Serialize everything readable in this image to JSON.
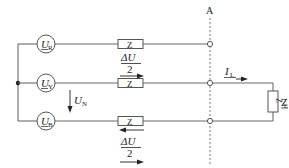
{
  "diagram": {
    "section_label": "A",
    "phases": [
      {
        "id": "R",
        "source_symbol": "U",
        "source_subscript": "R",
        "impedance_label": "Z",
        "drop_label_num": "ΔU",
        "drop_label_den": "2",
        "drop_arrow": "right"
      },
      {
        "id": "Y",
        "source_symbol": "U",
        "source_subscript": "Y",
        "impedance_label": "Z",
        "drop_arrow": "right"
      },
      {
        "id": "B",
        "source_symbol": "U",
        "source_subscript": "B",
        "impedance_label": "Z",
        "drop_label_num": "ΔU",
        "drop_label_den": "2",
        "drop_arrow_top": "left",
        "drop_arrow_bottom": "right"
      }
    ],
    "neutral_voltage": {
      "symbol": "U",
      "subscript": "N"
    },
    "load_current": {
      "symbol": "I",
      "subscript": "L"
    },
    "load": {
      "symbol": "Z",
      "subscript": "L",
      "box_label": "Z"
    },
    "colors": {
      "wire": "#6b6b6b",
      "text": "#222222",
      "background": "#ffffff"
    }
  }
}
